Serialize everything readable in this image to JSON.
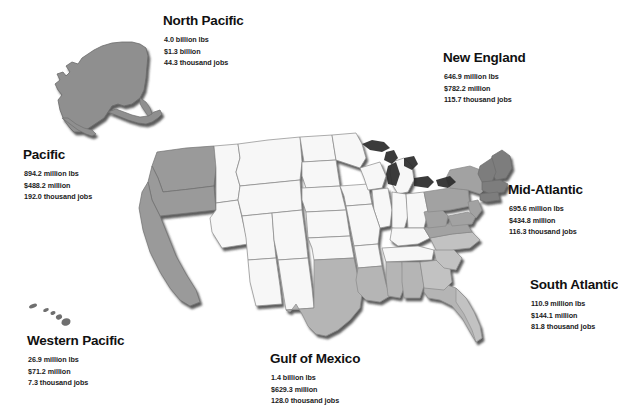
{
  "map": {
    "title_alt": "United States fisheries regions map",
    "colors": {
      "background": "#ffffff",
      "state_unshaded": "#f7f7f7",
      "state_outline": "#8a8a8a",
      "coast_shadow": "#1a1a1a",
      "region_north_pacific": "#8f8f8f",
      "region_pacific": "#9a9a9a",
      "region_western_pacific": "#6f6f6f",
      "region_new_england": "#7d7d7d",
      "region_mid_atlantic": "#a2a2a2",
      "region_south_atlantic": "#c2c2c2",
      "region_gulf": "#b5b5b5"
    }
  },
  "regions": [
    {
      "id": "north-pacific",
      "name": "North Pacific",
      "landings_lbs": "4.0 billion lbs",
      "value_usd": "$1.3 billion",
      "jobs": "44.3 thousand jobs"
    },
    {
      "id": "new-england",
      "name": "New England",
      "landings_lbs": "646.9 million lbs",
      "value_usd": "$782.2 million",
      "jobs": "115.7 thousand jobs"
    },
    {
      "id": "pacific",
      "name": "Pacific",
      "landings_lbs": "894.2 million lbs",
      "value_usd": "$488.2 million",
      "jobs": "192.0 thousand jobs"
    },
    {
      "id": "mid-atlantic",
      "name": "Mid-Atlantic",
      "landings_lbs": "695.6 million lbs",
      "value_usd": "$434.8 million",
      "jobs": "116.3 thousand jobs"
    },
    {
      "id": "south-atlantic",
      "name": "South Atlantic",
      "landings_lbs": "110.9 million lbs",
      "value_usd": "$144.1 million",
      "jobs": "81.8 thousand jobs"
    },
    {
      "id": "western-pacific",
      "name": "Western Pacific",
      "landings_lbs": "26.9 million lbs",
      "value_usd": "$71.2 million",
      "jobs": "7.3 thousand jobs"
    },
    {
      "id": "gulf-of-mexico",
      "name": "Gulf of Mexico",
      "landings_lbs": "1.4 billion lbs",
      "value_usd": "$629.3 million",
      "jobs": "128.0 thousand jobs"
    }
  ]
}
